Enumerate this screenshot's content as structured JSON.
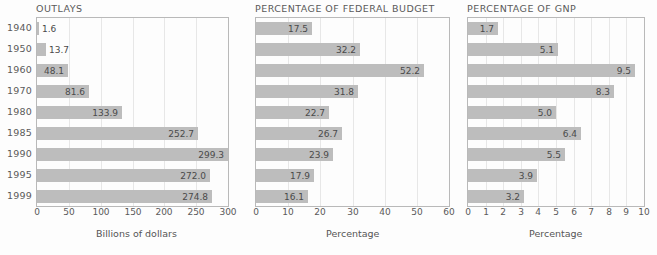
{
  "figure": {
    "years": [
      "1940",
      "1950",
      "1960",
      "1970",
      "1980",
      "1985",
      "1990",
      "1995",
      "1999"
    ],
    "bar_color": "#bdbdbd",
    "frame_color": "#b9b9b9",
    "grid_color": "#e7e7e7",
    "background": "#fdfdfd"
  },
  "chart_data": [
    {
      "type": "bar",
      "orientation": "horizontal",
      "title": "OUTLAYS",
      "xlabel": "Billions of dollars",
      "ylabel": "",
      "categories": [
        "1940",
        "1950",
        "1960",
        "1970",
        "1980",
        "1985",
        "1990",
        "1995",
        "1999"
      ],
      "values": [
        1.6,
        13.7,
        48.1,
        81.6,
        133.9,
        252.7,
        299.3,
        272.0,
        274.8
      ],
      "data_labels": [
        "1.6",
        "13.7",
        "48.1",
        "81.6",
        "133.9",
        "252.7",
        "299.3",
        "272.0",
        "274.8"
      ],
      "xlim": [
        0,
        300
      ],
      "xticks": [
        0,
        50,
        100,
        150,
        200,
        250,
        300
      ],
      "xticklabels": [
        "0",
        "50",
        "100",
        "150",
        "200",
        "250",
        "300"
      ],
      "grid": true,
      "legend": "none"
    },
    {
      "type": "bar",
      "orientation": "horizontal",
      "title": "PERCENTAGE OF FEDERAL BUDGET",
      "xlabel": "Percentage",
      "ylabel": "",
      "categories": [
        "1940",
        "1950",
        "1960",
        "1970",
        "1980",
        "1985",
        "1990",
        "1995",
        "1999"
      ],
      "values": [
        17.5,
        32.2,
        52.2,
        31.8,
        22.7,
        26.7,
        23.9,
        17.9,
        16.1
      ],
      "data_labels": [
        "17.5",
        "32.2",
        "52.2",
        "31.8",
        "22.7",
        "26.7",
        "23.9",
        "17.9",
        "16.1"
      ],
      "xlim": [
        0,
        60
      ],
      "xticks": [
        0,
        10,
        20,
        30,
        40,
        50,
        60
      ],
      "xticklabels": [
        "0",
        "10",
        "20",
        "30",
        "40",
        "50",
        "60"
      ],
      "grid": true,
      "legend": "none"
    },
    {
      "type": "bar",
      "orientation": "horizontal",
      "title": "PERCENTAGE OF GNP",
      "xlabel": "Percentage",
      "ylabel": "",
      "categories": [
        "1940",
        "1950",
        "1960",
        "1970",
        "1980",
        "1985",
        "1990",
        "1995",
        "1999"
      ],
      "values": [
        1.7,
        5.1,
        9.5,
        8.3,
        5.0,
        6.4,
        5.5,
        3.9,
        3.2
      ],
      "data_labels": [
        "1.7",
        "5.1",
        "9.5",
        "8.3",
        "5.0",
        "6.4",
        "5.5",
        "3.9",
        "3.2"
      ],
      "xlim": [
        0,
        10
      ],
      "xticks": [
        0,
        1,
        2,
        3,
        4,
        5,
        6,
        7,
        8,
        9,
        10
      ],
      "xticklabels": [
        "0",
        "1",
        "2",
        "3",
        "4",
        "5",
        "6",
        "7",
        "8",
        "9",
        "10"
      ],
      "grid": true,
      "legend": "none"
    }
  ]
}
